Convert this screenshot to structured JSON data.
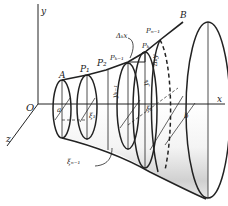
{
  "figure": {
    "type": "solid-of-revolution",
    "axes": {
      "y": "y",
      "x": "x",
      "z": "z",
      "origin": "O"
    },
    "points": {
      "A": "A",
      "P1": "P₁",
      "P2": "P₂",
      "Pk_minus_1": "Pₖ₋₁",
      "Pk": "Pₖ",
      "Pn_minus_1": "Pₙ₋₁",
      "B": "B"
    },
    "labels": {
      "a": "a",
      "b": "b",
      "xi1": "ξ₁",
      "xik": "ξₖ",
      "xin_minus_1": "ξₙ₋₁",
      "delta_k_x": "Δₖx",
      "delta_k_y": "Δₖy",
      "y_k_minus_1": "yₖ₋₁",
      "y_k": "yₖ"
    },
    "colors": {
      "ink": "#222222",
      "shade_dark": "#bdbdbd",
      "shade_light": "#f2f2f2",
      "background": "#ffffff"
    }
  }
}
